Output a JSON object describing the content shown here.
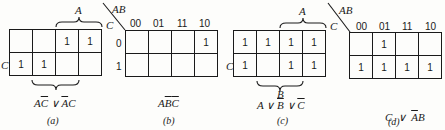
{
  "figures": [
    {
      "id": "a",
      "caption": "(a)",
      "top_label": "A",
      "left_label": "C",
      "bottom_label": "",
      "rows": [
        [
          "",
          "",
          "1",
          "1"
        ],
        [
          "1",
          "1",
          "",
          ""
        ]
      ],
      "expression": [
        {
          "t": "A",
          "over": false
        },
        {
          "t": "C",
          "over": true
        },
        {
          "t": " ∨ ",
          "over": false
        },
        {
          "t": "A",
          "over": true
        },
        {
          "t": "C",
          "over": false
        }
      ]
    },
    {
      "id": "b",
      "caption": "(b)",
      "corner_top": "AB",
      "corner_left": "C",
      "col_headers": [
        "00",
        "01",
        "11",
        "10"
      ],
      "row_headers": [
        "0",
        "1"
      ],
      "rows": [
        [
          "",
          "",
          "",
          "1"
        ],
        [
          "",
          "",
          "",
          ""
        ]
      ],
      "expression": [
        {
          "t": "A",
          "over": false
        },
        {
          "t": "B",
          "over": true
        },
        {
          "t": "C",
          "over": true
        }
      ]
    },
    {
      "id": "c",
      "caption": "(c)",
      "top_label": "A",
      "left_label": "C",
      "bottom_label": "B",
      "rows": [
        [
          "1",
          "1",
          "1",
          "1"
        ],
        [
          "1",
          "",
          "1",
          "1"
        ]
      ],
      "expression": [
        {
          "t": "A",
          "over": false
        },
        {
          "t": " ∨ ",
          "over": false
        },
        {
          "t": "B",
          "over": true
        },
        {
          "t": " ∨ ",
          "over": false
        },
        {
          "t": "C",
          "over": true
        }
      ]
    },
    {
      "id": "d",
      "caption": "(d)",
      "corner_top": "AB",
      "corner_left": "C",
      "col_headers": [
        "00",
        "01",
        "11",
        "10"
      ],
      "row_headers": [
        "0",
        "1"
      ],
      "rows": [
        [
          "",
          "1",
          "",
          ""
        ],
        [
          "1",
          "1",
          "1",
          "1"
        ]
      ],
      "expression": [
        {
          "t": "C",
          "over": false
        },
        {
          "t": "  ∨  ",
          "over": false
        },
        {
          "t": "A",
          "over": true
        },
        {
          "t": "B",
          "over": false
        }
      ]
    }
  ]
}
